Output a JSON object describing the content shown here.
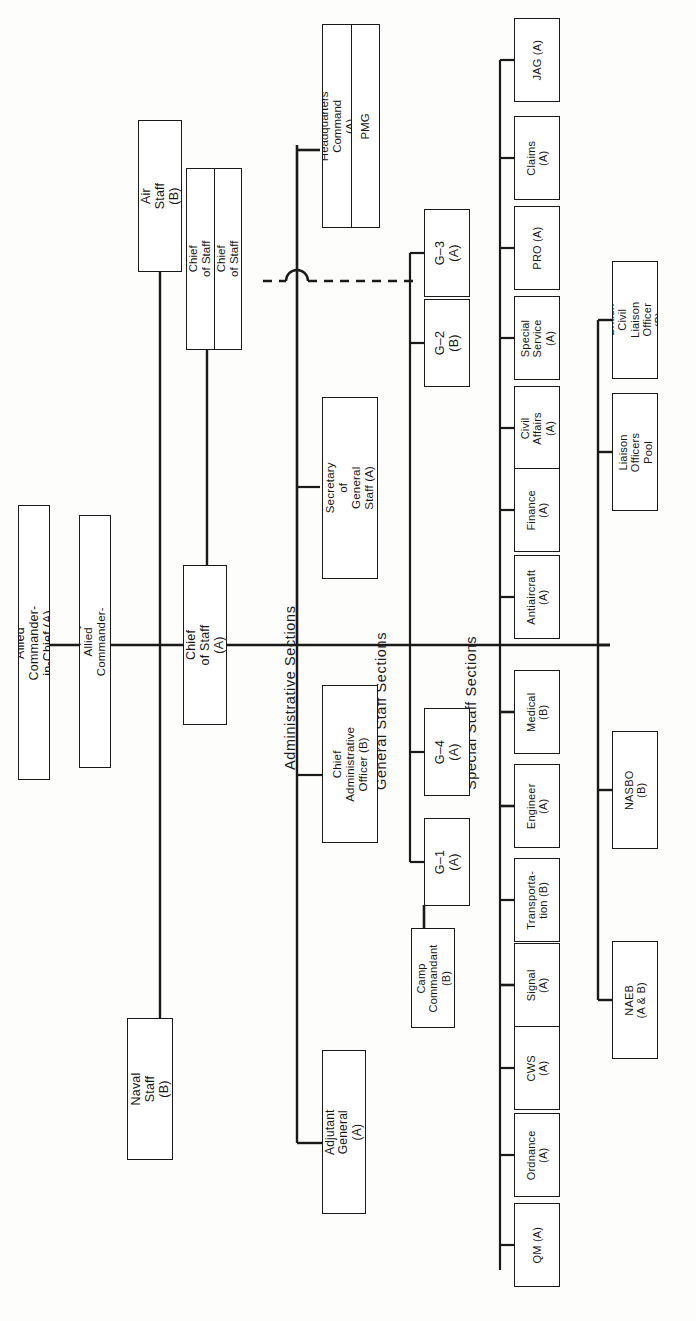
{
  "chart": {
    "kind": "organization-chart",
    "orientation": "rotated-90-ccw",
    "note_key": {
      "A": "(A)",
      "B": "(B)",
      "AB": "(A & B)"
    },
    "section_labels": {
      "administrative": "Administrative  Sections",
      "general": "General  Staff  Sections",
      "special": "Special  Staff  Sections"
    },
    "nodes": {
      "allied_commander": "Allied Commander-in-Chief (A)",
      "deputy_allied_commander": "Deputy Allied Commander-in-Chief (A)",
      "chief_of_staff": "Chief of Staff (A)",
      "air_staff": "Air Staff (B)",
      "naval_staff": "Naval Staff (B)",
      "deputy_chief_of_staff_a": "Deputy Chief of Staff (A)",
      "deputy_chief_of_staff_b": "Deputy Chief of Staff (B)",
      "headquarters_command": "Headquarters Command (A)",
      "pmg": "PMG",
      "secretary_general_staff": "Secretary of General\nStaff (A)",
      "chief_admin_officer": "Chief Administrative\nOfficer (B)",
      "adjutant_general": "Adjutant General (A)",
      "camp_commandant": "Camp\nCommandant (B)",
      "g1": "G–1 (A)",
      "g2": "G–2 (B)",
      "g3": "G–3 (A)",
      "g4": "G–4 (A)"
    },
    "general_staff_upper": [
      {
        "id": "g3",
        "label": "G–3 (A)"
      },
      {
        "id": "g2",
        "label": "G–2 (B)"
      }
    ],
    "general_staff_lower": [
      {
        "id": "g4",
        "label": "G–4 (A)"
      },
      {
        "id": "g1",
        "label": "G–1 (A)"
      }
    ],
    "special_staff_upper": [
      {
        "id": "jag",
        "label": "JAG (A)"
      },
      {
        "id": "claims",
        "label": "Claims (A)"
      },
      {
        "id": "pro",
        "label": "PRO (A)"
      },
      {
        "id": "special-service",
        "label": "Special\nService (A)"
      },
      {
        "id": "civil-affairs",
        "label": "Civil Affairs\n(A)"
      },
      {
        "id": "finance",
        "label": "Finance (A)"
      },
      {
        "id": "antiaircraft",
        "label": "Antiaircraft\n(A)"
      }
    ],
    "special_staff_lower": [
      {
        "id": "medical",
        "label": "Medical (B)"
      },
      {
        "id": "engineer",
        "label": "Engineer (A)"
      },
      {
        "id": "transportation",
        "label": "Transporta-\ntion (B)"
      },
      {
        "id": "signal",
        "label": "Signal (A)"
      },
      {
        "id": "cws",
        "label": "CWS (A)"
      },
      {
        "id": "ordnance",
        "label": "Ordnance\n(A)"
      },
      {
        "id": "qm",
        "label": "QM (A)"
      }
    ],
    "liaison_row": [
      {
        "id": "british-civil-liaison-officer",
        "label": "British Civil Liaison\nOfficer (B)"
      },
      {
        "id": "liaison-officers-pool",
        "label": "Liaison Officers Pool"
      },
      {
        "id": "nasbo",
        "label": "NASBO (B)"
      },
      {
        "id": "naeb",
        "label": "NAEB (A & B)"
      }
    ],
    "colors": {
      "ink": "#161616",
      "line": "#1a1a1a",
      "paper": "#fdfdfc"
    }
  }
}
